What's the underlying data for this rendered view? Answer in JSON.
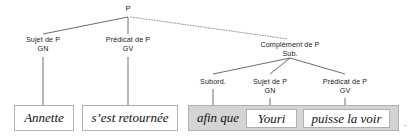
{
  "diagram": {
    "type": "syntax-tree",
    "language": "fr",
    "root": {
      "label": "P",
      "x": 128,
      "y": 8
    },
    "nodes": [
      {
        "id": "sujet-p",
        "line1": "Sujet de P",
        "line2": "GN",
        "x": 43,
        "y": 36
      },
      {
        "id": "predicat-p",
        "line1": "Prédicat de P",
        "line2": "GV",
        "x": 128,
        "y": 36
      },
      {
        "id": "complement-p",
        "line1": "Complément de P",
        "line2": "Sub.",
        "x": 290,
        "y": 41
      },
      {
        "id": "subord",
        "line1": "Subord.",
        "line2": "",
        "x": 213,
        "y": 78
      },
      {
        "id": "sujet-p-sub",
        "line1": "Sujet de P",
        "line2": "GN",
        "x": 270,
        "y": 78
      },
      {
        "id": "predicat-p-sub",
        "line1": "Prédicat de P",
        "line2": "GV",
        "x": 345,
        "y": 78
      }
    ],
    "edges": [
      {
        "from": "P",
        "to": "sujet-p",
        "style": "solid",
        "x1": 128,
        "y1": 17,
        "x2": 43,
        "y2": 34
      },
      {
        "from": "P",
        "to": "predicat-p",
        "style": "solid",
        "x1": 128,
        "y1": 17,
        "x2": 128,
        "y2": 34
      },
      {
        "from": "P",
        "to": "complement-p",
        "style": "dotted",
        "x1": 131,
        "y1": 17,
        "x2": 288,
        "y2": 39
      },
      {
        "from": "complement-p",
        "to": "subord",
        "style": "solid",
        "x1": 290,
        "y1": 58,
        "x2": 213,
        "y2": 74
      },
      {
        "from": "complement-p",
        "to": "sujet-p-sub",
        "style": "solid",
        "x1": 290,
        "y1": 58,
        "x2": 270,
        "y2": 74
      },
      {
        "from": "complement-p",
        "to": "predicat-p-sub",
        "style": "solid",
        "x1": 290,
        "y1": 58,
        "x2": 345,
        "y2": 74
      },
      {
        "from": "sujet-p",
        "to": "leaf-annette",
        "style": "solid",
        "x1": 43,
        "y1": 57,
        "x2": 43,
        "y2": 105
      },
      {
        "from": "predicat-p",
        "to": "leaf-sest-retournee",
        "style": "solid",
        "x1": 128,
        "y1": 57,
        "x2": 128,
        "y2": 105
      },
      {
        "from": "subord",
        "to": "leaf-afin-que",
        "style": "solid",
        "x1": 213,
        "y1": 90,
        "x2": 213,
        "y2": 105
      },
      {
        "from": "sujet-p-sub",
        "to": "leaf-youri",
        "style": "solid",
        "x1": 270,
        "y1": 99,
        "x2": 270,
        "y2": 109
      },
      {
        "from": "predicat-p-sub",
        "to": "leaf-puisse-la-voir",
        "style": "solid",
        "x1": 345,
        "y1": 99,
        "x2": 345,
        "y2": 109
      }
    ],
    "leaves": [
      {
        "id": "leaf-annette",
        "text": "Annette",
        "x": 14,
        "y": 105,
        "w": 60,
        "h": 26,
        "fill": "#ffffff"
      },
      {
        "id": "leaf-sest-retournee",
        "text": "s’est retournée",
        "x": 82,
        "y": 105,
        "w": 96,
        "h": 26,
        "fill": "#ffffff"
      },
      {
        "id": "leaf-youri",
        "text": "Youri",
        "x": 246,
        "y": 109,
        "w": 51,
        "h": 19,
        "fill": "#ffffff"
      },
      {
        "id": "leaf-puisse-la-voir",
        "text": "puisse la voir",
        "x": 303,
        "y": 109,
        "w": 87,
        "h": 19,
        "fill": "#ffffff"
      }
    ],
    "group": {
      "id": "group-subordinate-clause",
      "x": 188,
      "y": 105,
      "w": 211,
      "h": 26,
      "fill": "#d4d4d4",
      "text": "afin que",
      "text_x": 192,
      "text_y": 105,
      "text_w": 52,
      "text_h": 26
    },
    "end_mark": {
      "text": ".",
      "x": 404,
      "y": 118
    },
    "colors": {
      "background": "#ffffff",
      "edge": "#4a4a4a",
      "box_border": "#b0b0b0",
      "group_fill": "#d4d4d4",
      "text": "#111111",
      "label_text": "#1a1a1a"
    }
  }
}
